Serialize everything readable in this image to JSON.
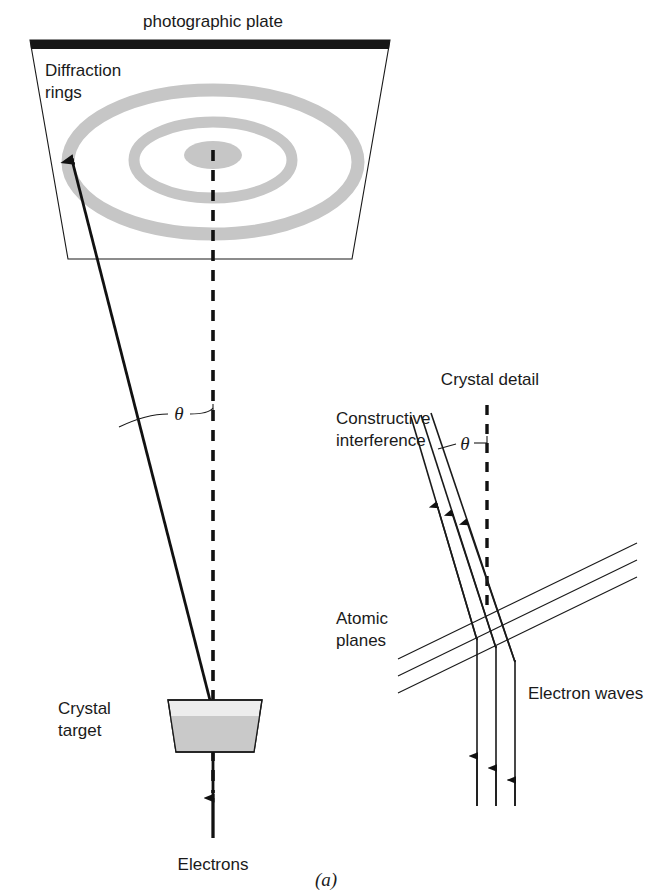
{
  "figure": {
    "caption": "(a)",
    "title_top": "photographic plate"
  },
  "labels": {
    "photographic_plate": "photographic plate",
    "diffraction_rings_line1": "Diffraction",
    "diffraction_rings_line2": "rings",
    "theta_main": "θ",
    "crystal_target_line1": "Crystal",
    "crystal_target_line2": "target",
    "electrons": "Electrons",
    "crystal_detail": "Crystal detail",
    "constructive_line1": "Constructive",
    "constructive_line2": "interference",
    "theta_inset": "θ",
    "atomic_planes_line1": "Atomic",
    "atomic_planes_line2": "planes",
    "electron_waves": "Electron waves"
  },
  "colors": {
    "ink": "#1a1a1a",
    "ring_gray": "#c6c6c6",
    "crystal_fill": "#c9c9c9",
    "crystal_fill_light": "#ededed",
    "plate_edge_black": "#161616",
    "background": "#ffffff"
  },
  "geometry": {
    "plate": {
      "top_left_x": 30,
      "top_right_x": 390,
      "top_y": 40,
      "bottom_left_x": 68,
      "bottom_right_x": 352,
      "bottom_y": 259,
      "black_band_height": 9
    },
    "rings": [
      {
        "cx": 213,
        "cy": 155,
        "rx": 29,
        "ry": 14,
        "type": "filled-center"
      },
      {
        "cx": 213,
        "cy": 160,
        "rx": 79,
        "ry": 38,
        "stroke_width": 11
      },
      {
        "cx": 213,
        "cy": 162,
        "rx": 145,
        "ry": 72,
        "stroke_width": 13
      }
    ],
    "center_dashed_line": {
      "x": 213,
      "y_top": 150,
      "y_bottom": 790
    },
    "diffracted_beam": {
      "x1": 213,
      "y1": 712,
      "x2": 70,
      "y2": 152
    },
    "crystal_target": {
      "top_left_x": 168,
      "top_right_x": 262,
      "top_y": 700,
      "bottom_left_x": 176,
      "bottom_right_x": 254,
      "bottom_y": 752
    },
    "electron_in_arrow": {
      "x": 213,
      "y_start": 838,
      "y_end": 752
    },
    "inset": {
      "dashed_line": {
        "x": 487,
        "y_top": 405,
        "y_bottom": 607
      },
      "beam_count": 3,
      "atomic_plane_count": 3
    }
  }
}
